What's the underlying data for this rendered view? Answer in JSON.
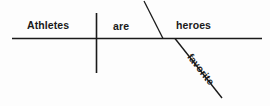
{
  "diagram": {
    "type": "reed-kellogg-sentence-diagram",
    "sentence": "Athletes are favorite heroes",
    "canvas": {
      "width": 270,
      "height": 106,
      "background": "#fdfdfd"
    },
    "ink_color": "#1a1a1a",
    "words": {
      "subject": "Athletes",
      "verb": "are",
      "predicate_nominative": "heroes",
      "modifier": "favorite"
    },
    "lines": {
      "baseline": {
        "x1": 12,
        "y1": 38.5,
        "x2": 262,
        "y2": 38.5
      },
      "subject_verb_divider": {
        "x1": 96.5,
        "y1": 13,
        "x2": 96.5,
        "y2": 73
      },
      "predicate_nominative_slant": {
        "x1": 144,
        "y1": 1,
        "x2": 163,
        "y2": 38.5
      },
      "modifier_diagonal": {
        "x1": 175,
        "y1": 38.5,
        "x2": 222,
        "y2": 98
      }
    }
  }
}
